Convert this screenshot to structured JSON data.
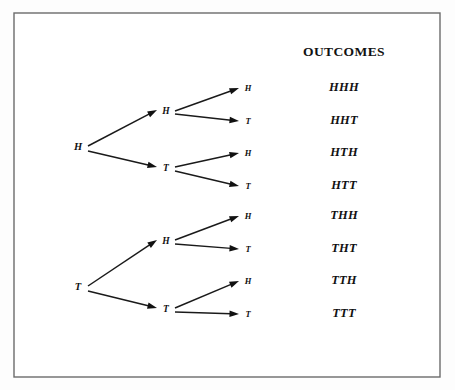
{
  "figure": {
    "type": "probability-tree-diagram",
    "background_color": "#fdfdfd",
    "frame": {
      "x": 14,
      "y": 13,
      "width": 426,
      "height": 364,
      "stroke_color": "#6b6b6b"
    },
    "ink_color": "#111111"
  },
  "outcomes_column": {
    "heading": "OUTCOMES",
    "heading_x": 344,
    "heading_y": 56,
    "x": 344,
    "items": [
      {
        "label": "HHH",
        "y": 91
      },
      {
        "label": "HHT",
        "y": 124
      },
      {
        "label": "HTH",
        "y": 156
      },
      {
        "label": "HTT",
        "y": 189
      },
      {
        "label": "THH",
        "y": 219
      },
      {
        "label": "THT",
        "y": 252
      },
      {
        "label": "TTH",
        "y": 284
      },
      {
        "label": "TTT",
        "y": 317
      }
    ]
  },
  "tree": {
    "roots": [
      {
        "label": "H",
        "x": 78,
        "y": 148
      },
      {
        "label": "T",
        "x": 78,
        "y": 288
      }
    ],
    "mid_nodes": [
      {
        "label": "H",
        "x": 166,
        "y": 112
      },
      {
        "label": "T",
        "x": 166,
        "y": 169
      },
      {
        "label": "H",
        "x": 166,
        "y": 242
      },
      {
        "label": "T",
        "x": 166,
        "y": 310
      }
    ],
    "leaf_nodes": [
      {
        "label": "H",
        "x": 248,
        "y": 89
      },
      {
        "label": "T",
        "x": 248,
        "y": 122
      },
      {
        "label": "H",
        "x": 248,
        "y": 154
      },
      {
        "label": "T",
        "x": 248,
        "y": 187
      },
      {
        "label": "H",
        "x": 248,
        "y": 217
      },
      {
        "label": "T",
        "x": 248,
        "y": 250
      },
      {
        "label": "H",
        "x": 248,
        "y": 282
      },
      {
        "label": "T",
        "x": 248,
        "y": 315
      }
    ],
    "branches": [
      {
        "from_x": 88,
        "from_y": 146,
        "to_x": 157,
        "to_y": 110,
        "label": "H-to-HH"
      },
      {
        "from_x": 88,
        "from_y": 151,
        "to_x": 157,
        "to_y": 167,
        "label": "H-to-HT"
      },
      {
        "from_x": 88,
        "from_y": 286,
        "to_x": 157,
        "to_y": 240,
        "label": "T-to-TH"
      },
      {
        "from_x": 88,
        "from_y": 291,
        "to_x": 157,
        "to_y": 308,
        "label": "T-to-TT"
      },
      {
        "from_x": 175,
        "from_y": 111,
        "to_x": 239,
        "to_y": 88,
        "label": "HH-to-HHH"
      },
      {
        "from_x": 175,
        "from_y": 114,
        "to_x": 239,
        "to_y": 121,
        "label": "HH-to-HHT"
      },
      {
        "from_x": 175,
        "from_y": 167,
        "to_x": 239,
        "to_y": 153,
        "label": "HT-to-HTH"
      },
      {
        "from_x": 175,
        "from_y": 171,
        "to_x": 239,
        "to_y": 186,
        "label": "HT-to-HTT"
      },
      {
        "from_x": 175,
        "from_y": 240,
        "to_x": 239,
        "to_y": 216,
        "label": "TH-to-THH"
      },
      {
        "from_x": 175,
        "from_y": 244,
        "to_x": 239,
        "to_y": 249,
        "label": "TH-to-THT"
      },
      {
        "from_x": 175,
        "from_y": 308,
        "to_x": 239,
        "to_y": 281,
        "label": "TT-to-TTH"
      },
      {
        "from_x": 175,
        "from_y": 312,
        "to_x": 239,
        "to_y": 314,
        "label": "TT-to-TTT"
      }
    ]
  }
}
